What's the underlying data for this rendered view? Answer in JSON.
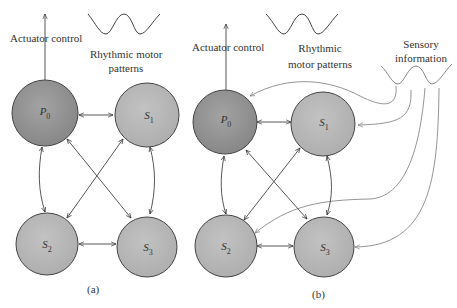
{
  "panels": [
    {
      "id": "a",
      "caption": "(a)",
      "actuator_label": "Actuator control",
      "rhythm_label_line1": "Rhythmic motor",
      "rhythm_label_line2": "patterns",
      "nodes": [
        {
          "name": "P",
          "sub": "0"
        },
        {
          "name": "S",
          "sub": "1"
        },
        {
          "name": "S",
          "sub": "2"
        },
        {
          "name": "S",
          "sub": "3"
        }
      ]
    },
    {
      "id": "b",
      "caption": "(b)",
      "actuator_label": "Actuator control",
      "rhythm_label_line1": "Rhythmic",
      "rhythm_label_line2": "motor patterns",
      "sensory_label_line1": "Sensory",
      "sensory_label_line2": "information",
      "nodes": [
        {
          "name": "P",
          "sub": "0"
        },
        {
          "name": "S",
          "sub": "1"
        },
        {
          "name": "S",
          "sub": "2"
        },
        {
          "name": "S",
          "sub": "3"
        }
      ]
    }
  ],
  "colors": {
    "pacemaker_fill": "#8e8e8e",
    "sensor_fill": "#b5b5b5",
    "stroke": "#444444",
    "sensory_line": "#888888"
  }
}
